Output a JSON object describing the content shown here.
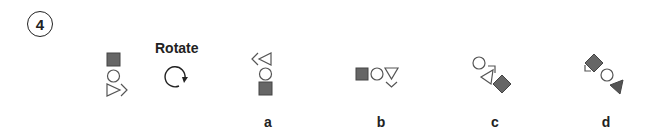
{
  "question": {
    "number": "4",
    "instruction": "Rotate",
    "instruction_icon": "rotate-clockwise-icon"
  },
  "colors": {
    "ink": "#222222",
    "fill_gray": "#666666",
    "stroke_gray": "#555555"
  },
  "source_figure": {
    "elements": [
      "filled-square",
      "circle",
      "triangle-right-with-chevron"
    ],
    "orientation": "vertical"
  },
  "options": [
    {
      "label": "a",
      "elements": [
        "chevron-triangle-left",
        "circle",
        "filled-square"
      ],
      "orientation": "vertical"
    },
    {
      "label": "b",
      "elements": [
        "filled-square",
        "circle",
        "triangle-down-with-chevron"
      ],
      "orientation": "horizontal"
    },
    {
      "label": "c",
      "elements": [
        "circle",
        "triangle-with-chevron",
        "filled-diamond"
      ],
      "orientation": "diagonal"
    },
    {
      "label": "d",
      "elements": [
        "filled-diamond-with-chevron",
        "circle",
        "filled-triangle"
      ],
      "orientation": "diagonal"
    }
  ]
}
